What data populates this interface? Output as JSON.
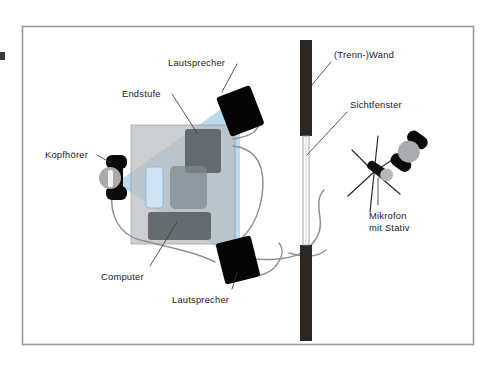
{
  "figure": {
    "kind": "technical-diagram",
    "frame": {
      "border_color": "#9a9a9a",
      "background": "#ffffff"
    }
  },
  "colors": {
    "frame_border": "#9a9a9a",
    "wall_dark": "#2b2622",
    "speaker_black": "#050505",
    "desk_gray": "#b9bcbe",
    "device_gray": "#5d6468",
    "screen_blue": "#cfe4f2",
    "cone_blue": "#aed3ec",
    "cable_gray": "#8e9194",
    "head_gray": "#a9abad",
    "text": "#1a1a1a",
    "window_line": "#9a9a9a"
  },
  "labels": [
    {
      "id": "lautsprecher-top",
      "text": "Lautsprecher",
      "x": 168,
      "y": 57,
      "target": "speaker-top"
    },
    {
      "id": "endstufe",
      "text": "Endstufe",
      "x": 122,
      "y": 88,
      "target": "amplifier"
    },
    {
      "id": "kopfhoerer",
      "text": "Kopfhörer",
      "x": 45,
      "y": 149,
      "target": "headphones"
    },
    {
      "id": "computer",
      "text": "Computer",
      "x": 101,
      "y": 271,
      "target": "computer"
    },
    {
      "id": "lautsprecher-bottom",
      "text": "Lautsprecher",
      "x": 172,
      "y": 294,
      "target": "speaker-bottom"
    },
    {
      "id": "trennwand",
      "text": "(Trenn-)Wand",
      "x": 334,
      "y": 49,
      "target": "wall"
    },
    {
      "id": "sichtfenster",
      "text": "Sichtfenster",
      "x": 350,
      "y": 99,
      "target": "window"
    },
    {
      "id": "mikrofon",
      "text": "Mikrofon\nmit Stativ",
      "x": 369,
      "y": 210,
      "target": "microphone"
    }
  ],
  "objects": {
    "speaker_top": {
      "name": "Lautsprecher",
      "kind": "loudspeaker"
    },
    "speaker_bottom": {
      "name": "Lautsprecher",
      "kind": "loudspeaker"
    },
    "amplifier": {
      "name": "Endstufe",
      "kind": "power-amplifier"
    },
    "headphones": {
      "name": "Kopfhörer",
      "kind": "headphones"
    },
    "computer": {
      "name": "Computer",
      "kind": "computer"
    },
    "wall": {
      "name": "(Trenn-)Wand",
      "kind": "partition-wall"
    },
    "window": {
      "name": "Sichtfenster",
      "kind": "viewing-window"
    },
    "microphone": {
      "name": "Mikrofon mit Stativ",
      "kind": "microphone-on-stand"
    },
    "talent": {
      "name": "Person mit Kopfhörer",
      "kind": "performer"
    },
    "desk": {
      "name": "Arbeitsplatz",
      "kind": "desk"
    },
    "stereo_cone": {
      "name": "Stereo-Abhördreieck",
      "kind": "listening-cone"
    }
  }
}
